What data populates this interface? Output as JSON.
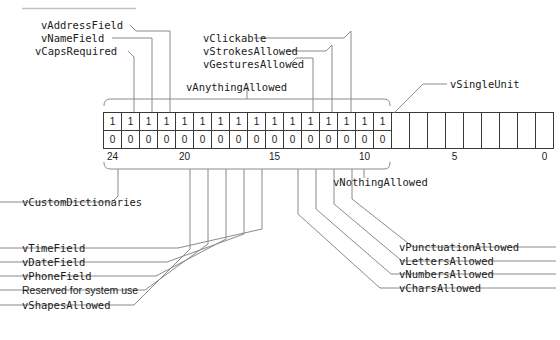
{
  "diagram": {
    "title_rule": "",
    "bit_table": {
      "high_bits_row1": [
        "1",
        "1",
        "1",
        "1",
        "1",
        "1",
        "1",
        "1",
        "1",
        "1",
        "1",
        "1",
        "1",
        "1",
        "1",
        "1"
      ],
      "high_bits_row2": [
        "0",
        "0",
        "0",
        "0",
        "0",
        "0",
        "0",
        "0",
        "0",
        "0",
        "0",
        "0",
        "0",
        "0",
        "0",
        "0"
      ],
      "empty_cell_count": 9,
      "axis_ticks": [
        "24",
        "20",
        "15",
        "10",
        "5",
        "0"
      ]
    },
    "braces": {
      "top_label": "vAnythingAllowed",
      "bottom_label": "vNothingAllowed"
    },
    "labels_top_left": [
      "vAddressField",
      "vNameField",
      "vCapsRequired"
    ],
    "labels_top_right": [
      "vClickable",
      "vStrokesAllowed",
      "vGesturesAllowed"
    ],
    "label_single_unit": "vSingleUnit",
    "labels_bottom_left": [
      "vCustomDictionaries",
      "vTimeField",
      "vDateField",
      "vPhoneField",
      "Reserved for system use",
      "vShapesAllowed"
    ],
    "labels_bottom_right": [
      "vCharsAllowed",
      "vNumbersAllowed",
      "vLettersAllowed",
      "vPunctuationAllowed"
    ],
    "colors": {
      "ink": "#1a1a1a",
      "rule": "#b9b9b9",
      "leader": "#6e6e6e",
      "cellborder": "#3a3a3a"
    }
  }
}
